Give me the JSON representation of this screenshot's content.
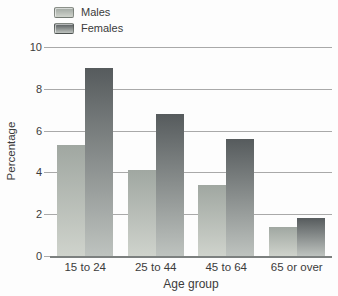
{
  "chart_data": {
    "type": "bar",
    "title": "",
    "categories": [
      "15 to 24",
      "25 to 44",
      "45 to 64",
      "65 or over"
    ],
    "series": [
      {
        "name": "Males",
        "values": [
          5.3,
          4.1,
          3.4,
          1.4
        ],
        "color_top": "#a0a7a1",
        "color_bottom": "#cfd3cc"
      },
      {
        "name": "Females",
        "values": [
          9.0,
          6.8,
          5.6,
          1.8
        ],
        "color_top": "#565b5d",
        "color_bottom": "#bec3bf"
      }
    ],
    "xlabel": "Age group",
    "ylabel": "Percentage",
    "ylim": [
      0,
      10
    ],
    "yticks": [
      0,
      2,
      4,
      6,
      8,
      10
    ],
    "grid": true,
    "legend_position": "top-left",
    "bar_width_px": 28
  },
  "colors": {
    "background": "#fdfdfd",
    "gridline": "#a9a9a9",
    "axis_line": "#7c807f",
    "text": "#3b3b3b"
  }
}
